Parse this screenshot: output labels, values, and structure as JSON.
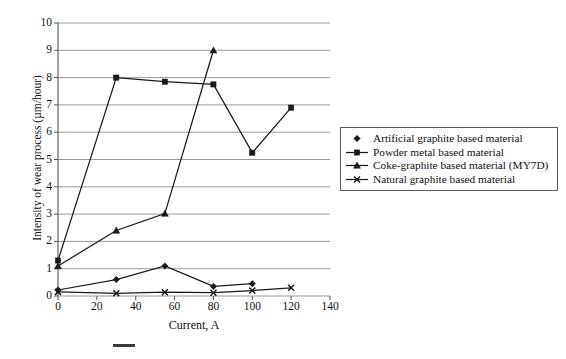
{
  "chart_data": {
    "type": "line",
    "title": "",
    "xlabel": "Current, A",
    "ylabel": "Intensity of wear process (µm/hour)",
    "xlim": [
      0,
      140
    ],
    "ylim": [
      0,
      10
    ],
    "xticks": [
      0,
      20,
      40,
      60,
      80,
      100,
      120,
      140
    ],
    "yticks": [
      0,
      1,
      2,
      3,
      4,
      5,
      6,
      7,
      8,
      9,
      10
    ],
    "grid": "horizontal",
    "legend_position": "right",
    "series": [
      {
        "name": "Artificial graphite based material",
        "marker": "diamond",
        "x": [
          0,
          30,
          55,
          80,
          100
        ],
        "y": [
          0.22,
          0.6,
          1.1,
          0.35,
          0.45
        ]
      },
      {
        "name": "Powder metal based material",
        "marker": "square",
        "x": [
          0,
          30,
          55,
          80,
          100,
          120
        ],
        "y": [
          1.3,
          8.0,
          7.85,
          7.75,
          5.25,
          6.9
        ]
      },
      {
        "name": "Coke-graphite based material (MY7D)",
        "marker": "triangle",
        "x": [
          0,
          30,
          55,
          80
        ],
        "y": [
          1.1,
          2.4,
          3.02,
          9.0
        ]
      },
      {
        "name": "Natural graphite based material",
        "marker": "x-cross",
        "x": [
          0,
          30,
          55,
          80,
          100,
          120
        ],
        "y": [
          0.15,
          0.1,
          0.14,
          0.12,
          0.2,
          0.3
        ]
      }
    ]
  },
  "axes": {
    "xlabel": "Current, A",
    "ylabel": "Intensity of wear process (µm/hour)",
    "xticks": [
      "0",
      "20",
      "40",
      "60",
      "80",
      "100",
      "120",
      "140"
    ],
    "yticks": [
      "0",
      "1",
      "2",
      "3",
      "4",
      "5",
      "6",
      "7",
      "8",
      "9",
      "10"
    ]
  },
  "legend": {
    "items": [
      {
        "label": "Artificial graphite based material",
        "marker": "diamond",
        "has_line": false
      },
      {
        "label": "Powder metal based material",
        "marker": "square",
        "has_line": true
      },
      {
        "label": "Coke-graphite based material (MY7D)",
        "marker": "triangle",
        "has_line": true
      },
      {
        "label": "Natural graphite based material",
        "marker": "x-cross",
        "has_line": true
      }
    ]
  },
  "colors": {
    "line": "#1a1a1a",
    "grid": "#8f8f8f",
    "axis": "#555555",
    "text": "#111111",
    "background": "#ffffff"
  }
}
